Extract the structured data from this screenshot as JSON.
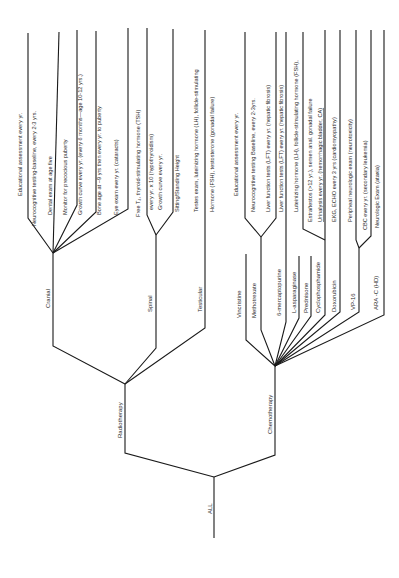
{
  "diagram": {
    "type": "tree",
    "orientation": "rotated-90-ccw",
    "root": {
      "label": "ALL",
      "children": [
        {
          "label": "Radiotherapy",
          "children": [
            {
              "label": "Cranial",
              "items": [
                "Educational assessment every yr.",
                "Neurocognitive testing-baseline, every 2-3 yrs.",
                "Dental exam at age five",
                "Monitor for precocious puberty",
                "Growth curve every yr. (every 6 months—age 10-12 yrs.)",
                "Bone age at ~9 yrs then every yr. to puberty",
                "Eye exam every yr. (cataracts)"
              ]
            },
            {
              "label": "Spinal",
              "items": [
                "Free T₄, thyroid-stimulating hormone (TSH)",
                "every yr. x 10 (hypothyroidism)",
                "Growth curve every yr.",
                "Sitting/Standing Height"
              ]
            },
            {
              "label": "Testicular",
              "items": [
                "Testes exam, luteinizing hormone (LH), follicle-stimulating",
                "Hormone (FSH), testosterone (gonadal failure)"
              ]
            }
          ]
        },
        {
          "label": "Chemotherapy",
          "children": [
            {
              "label": "Vincristine",
              "items": []
            },
            {
              "label": "Methotrexate",
              "items": [
                "Educational assessment every yr.",
                "Neurocognitive testing  Baseline, every 2-3yrs.",
                "Liver function tests (LFT) every yr. (hepatic fibrosis)"
              ]
            },
            {
              "label": "6-mercaptopurine",
              "items": [
                "Liver function tests (LFT) every yr. (hepatic fibrosis)"
              ]
            },
            {
              "label": "L-asparaginase",
              "items": []
            },
            {
              "label": "Prednisone",
              "items": []
            },
            {
              "label": "Cyclophosphamide",
              "items": [
                "Luteinizing hormone (LH), follicle-stimulating hormone (FSH),",
                "Estradiol/testos (>12 yr.), semen anal. gonadal failure",
                "Urinalysis every yr. (hemorrhagic bladder,  CA)"
              ]
            },
            {
              "label": "Doxorubicin",
              "items": [
                "EKG, ECHO every 3 yrs (cardiomyopathy)"
              ]
            },
            {
              "label": "VP-16",
              "items": [
                "Peripheal neurologic exam (neurotoxicity)",
                "CBC every yr. (secondary leukemia)"
              ]
            },
            {
              "label": "ARA -C (HD)",
              "items": [
                "Neurologic Exam (ataxia)"
              ]
            }
          ]
        }
      ]
    }
  },
  "labels": {
    "root": "ALL",
    "radiotherapy": "Radiotherapy",
    "chemotherapy": "Chemotherapy",
    "cranial": "Cranial",
    "spinal": "Spinal",
    "testicular": "Testicular",
    "vincristine": "Vincristine",
    "methotrexate": "Methotrexate",
    "mercaptopurine": "6-mercaptopurine",
    "asparaginase": "L-asparaginase",
    "prednisone": "Prednisone",
    "cyclophosphamide": "Cyclophosphamide",
    "doxorubicin": "Doxorubicin",
    "vp16": "VP-16",
    "arac": "ARA -C (HD)",
    "cranial_items": [
      "Educational assessment every yr.",
      "Neurocognitive testing-baseline, every 2-3 yrs.",
      "Dental exam at age five",
      "Monitor for precocious puberty",
      "Growth curve every yr. (every 6 months—age 10-12 yrs.)",
      "Bone age at ~9 yrs then every yr. to puberty",
      "Eye exam every yr. (cataracts)"
    ],
    "spinal_items": [
      "Free T₄, thyroid-stimulating hormone (TSH)",
      "every yr. x 10 (hypothyroidism)",
      "Growth curve every yr.",
      "Sitting/Standing Height"
    ],
    "testicular_items": [
      "Testes exam, luteinizing hormone (LH), follicle-stimulating",
      "Hormone (FSH), testosterone (gonadal failure)"
    ],
    "chemo_items": [
      "Educational assessment every yr.",
      "Neurocognitive testing  Baseline, every 2-3yrs.",
      "Liver function tests (LFT) every yr. (hepatic fibrosis)",
      "Liver function tests (LFT) every yr. (hepatic fibrosis)",
      "Luteinizing hormone (LH), follicle-stimulating hormone (FSH),",
      "Estra/testos (>12 yr.), semen anal. gonadal failure",
      "Urinalysis every yr. (hemorrhagic bladder,  CA)",
      "EKG, ECHO every 3 yrs (cardiomyopathy)",
      "Peripheal neurologic exam (neurotoxicity)",
      "CBC every yr. (secondary leukemia)",
      "Neurologic Exam (ataxia)"
    ]
  },
  "colors": {
    "line": "#1a1a1a",
    "text": "#2a2a2a",
    "background": "#ffffff"
  }
}
